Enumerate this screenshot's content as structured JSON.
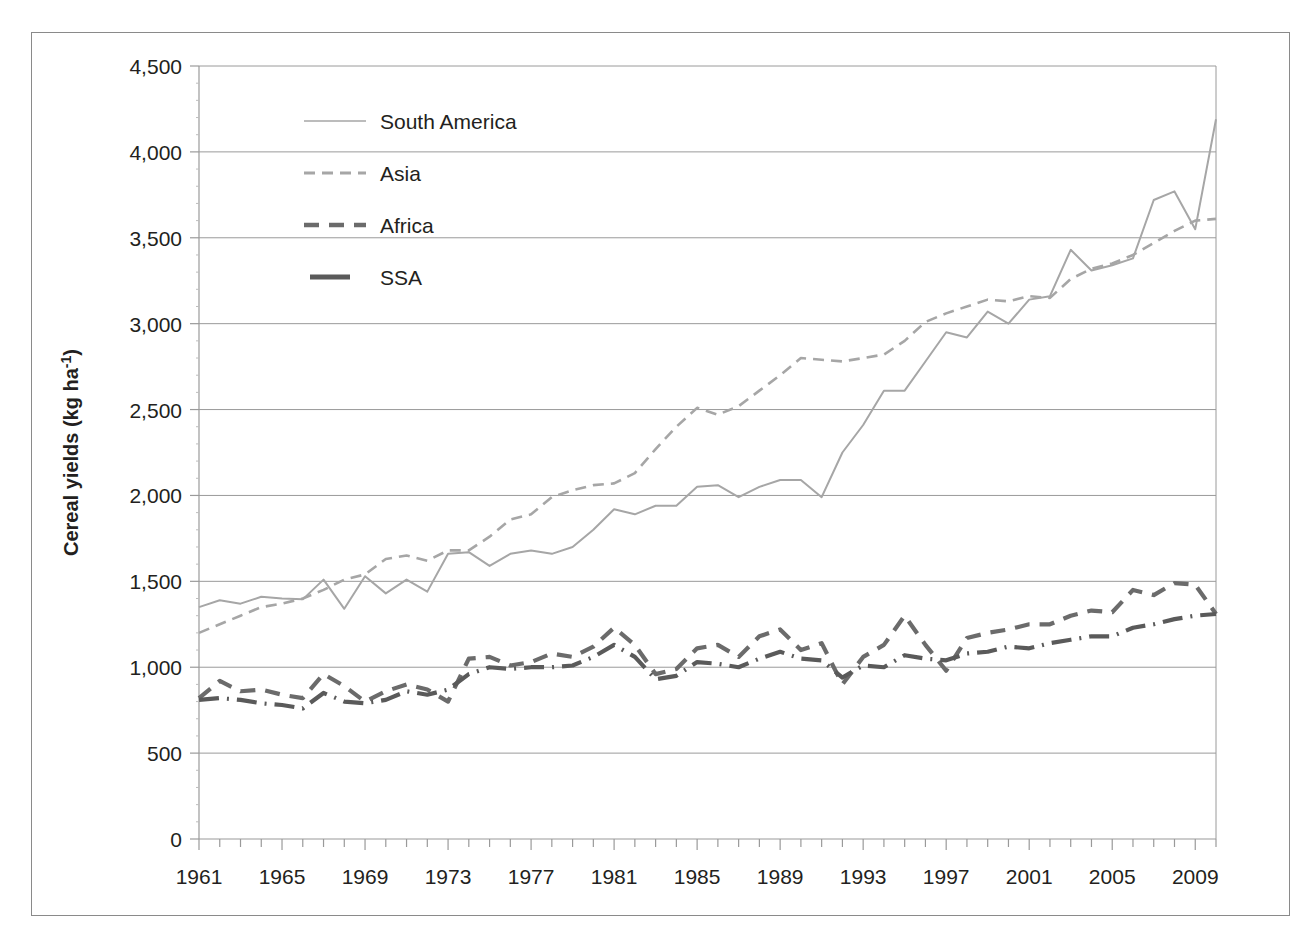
{
  "chart_data": {
    "type": "line",
    "title": "",
    "xlabel": "",
    "ylabel": "Cereal yields (kg ha-1)",
    "ylabel_display": "Cereal yields (kg ha",
    "ylabel_sup": "-1",
    "ylabel_tail": ")",
    "xlim": [
      1961,
      2010
    ],
    "ylim": [
      0,
      4500
    ],
    "grid": true,
    "legend_position": "upper-left-inside",
    "x_tick_labels": [
      "1961",
      "1965",
      "1969",
      "1973",
      "1977",
      "1981",
      "1985",
      "1989",
      "1993",
      "1997",
      "2001",
      "2005",
      "2009"
    ],
    "x_tick_values": [
      1961,
      1965,
      1969,
      1973,
      1977,
      1981,
      1985,
      1989,
      1993,
      1997,
      2001,
      2005,
      2009
    ],
    "y_tick_labels": [
      "0",
      "500",
      "1,000",
      "1,500",
      "2,000",
      "2,500",
      "3,000",
      "3,500",
      "4,000",
      "4,500"
    ],
    "y_tick_values": [
      0,
      500,
      1000,
      1500,
      2000,
      2500,
      3000,
      3500,
      4000,
      4500
    ],
    "x": [
      1961,
      1962,
      1963,
      1964,
      1965,
      1966,
      1967,
      1968,
      1969,
      1970,
      1971,
      1972,
      1973,
      1974,
      1975,
      1976,
      1977,
      1978,
      1979,
      1980,
      1981,
      1982,
      1983,
      1984,
      1985,
      1986,
      1987,
      1988,
      1989,
      1990,
      1991,
      1992,
      1993,
      1994,
      1995,
      1996,
      1997,
      1998,
      1999,
      2000,
      2001,
      2002,
      2003,
      2004,
      2005,
      2006,
      2007,
      2008,
      2009,
      2010
    ],
    "series": [
      {
        "name": "South America",
        "style": "solid-thin",
        "color": "#a6a6a6",
        "values": [
          1350,
          1390,
          1370,
          1410,
          1400,
          1395,
          1510,
          1340,
          1530,
          1430,
          1510,
          1440,
          1660,
          1670,
          1590,
          1660,
          1680,
          1660,
          1700,
          1800,
          1920,
          1890,
          1940,
          1940,
          2050,
          2060,
          1990,
          2050,
          2090,
          2090,
          1990,
          2250,
          2410,
          2610,
          2610,
          2780,
          2950,
          2920,
          3070,
          3000,
          3140,
          3160,
          3430,
          3310,
          3340,
          3380,
          3720,
          3770,
          3550,
          4190
        ]
      },
      {
        "name": "Asia",
        "style": "dashed-medium",
        "color": "#a6a6a6",
        "values": [
          1200,
          1250,
          1300,
          1350,
          1370,
          1400,
          1450,
          1510,
          1540,
          1630,
          1650,
          1620,
          1680,
          1680,
          1760,
          1860,
          1890,
          1990,
          2030,
          2060,
          2070,
          2130,
          2270,
          2400,
          2510,
          2470,
          2520,
          2610,
          2700,
          2800,
          2790,
          2780,
          2800,
          2820,
          2900,
          3010,
          3060,
          3100,
          3140,
          3130,
          3160,
          3150,
          3260,
          3320,
          3350,
          3400,
          3470,
          3540,
          3600,
          3610
        ]
      },
      {
        "name": "Africa",
        "style": "dashed-bold",
        "color": "#6b6b6b",
        "values": [
          820,
          920,
          860,
          870,
          840,
          820,
          960,
          890,
          800,
          860,
          900,
          870,
          800,
          1050,
          1060,
          1010,
          1030,
          1080,
          1060,
          1120,
          1230,
          1130,
          960,
          990,
          1110,
          1130,
          1060,
          1180,
          1220,
          1100,
          1140,
          900,
          1060,
          1130,
          1300,
          1130,
          980,
          1170,
          1200,
          1220,
          1250,
          1250,
          1300,
          1330,
          1320,
          1450,
          1420,
          1490,
          1480,
          1310
        ]
      },
      {
        "name": "SSA",
        "style": "dashdot-bold",
        "color": "#5a5a5a",
        "values": [
          810,
          820,
          810,
          790,
          780,
          760,
          850,
          800,
          790,
          810,
          860,
          840,
          870,
          960,
          1000,
          990,
          1000,
          1000,
          1010,
          1060,
          1130,
          1060,
          930,
          950,
          1030,
          1020,
          1000,
          1050,
          1090,
          1050,
          1040,
          940,
          1010,
          1000,
          1070,
          1050,
          1040,
          1080,
          1090,
          1120,
          1110,
          1140,
          1160,
          1180,
          1180,
          1230,
          1250,
          1280,
          1300,
          1310
        ]
      }
    ]
  },
  "legend": {
    "items": [
      {
        "label": "South America",
        "swatch": "solid-thin-line-icon"
      },
      {
        "label": "Asia",
        "swatch": "dashed-line-icon"
      },
      {
        "label": "Africa",
        "swatch": "dashed-bold-line-icon"
      },
      {
        "label": "SSA",
        "swatch": "solid-bold-line-icon"
      }
    ]
  }
}
